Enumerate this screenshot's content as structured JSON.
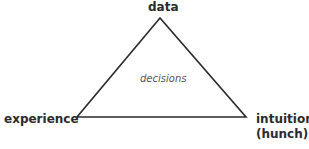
{
  "diagram": {
    "type": "triangle",
    "vertices": {
      "top": "data",
      "left": "experience",
      "right_line1": "intuition",
      "right_line2": "(hunch)"
    },
    "center_label": "decisions",
    "line_color": "#2a2a2a"
  }
}
